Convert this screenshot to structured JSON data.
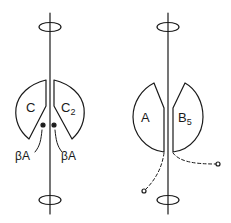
{
  "diagram": {
    "type": "schematic",
    "stroke_color": "#1a1a1a",
    "background": "#ffffff",
    "left_figure": {
      "axis": {
        "x": 50,
        "y1": 13,
        "y2": 214
      },
      "ellipses": [
        {
          "cx": 50,
          "cy": 27
        },
        {
          "cx": 50,
          "cy": 200
        }
      ],
      "subunits": [
        {
          "label": "C",
          "sub": ""
        },
        {
          "label": "C",
          "sub": "2"
        }
      ],
      "sites": [
        {
          "label": "βA"
        },
        {
          "label": "βA"
        }
      ]
    },
    "right_figure": {
      "axis": {
        "x": 168,
        "y1": 13,
        "y2": 214
      },
      "ellipses": [
        {
          "cx": 168,
          "cy": 27
        },
        {
          "cx": 168,
          "cy": 200
        }
      ],
      "subunits": [
        {
          "label": "A",
          "sub": ""
        },
        {
          "label": "B",
          "sub": "5"
        }
      ],
      "tethers": [
        "dashed-left",
        "dashed-right"
      ]
    }
  }
}
